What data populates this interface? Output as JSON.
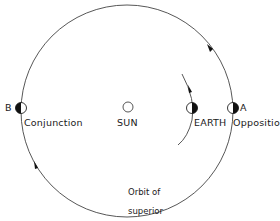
{
  "diagram": {
    "type": "orbital-configuration",
    "bodies": {
      "sun": {
        "label": "SUN"
      },
      "earth": {
        "label": "EARTH"
      },
      "planet_a": {
        "letter": "A",
        "position_label": "Opposition"
      },
      "planet_b": {
        "letter": "B",
        "position_label": "Conjunction"
      }
    },
    "orbit_label": {
      "line1": "Orbit of",
      "line2": "superior",
      "line3": "planet"
    },
    "colors": {
      "line": "#333333",
      "fill_dark": "#111111",
      "background": "#ffffff"
    }
  }
}
